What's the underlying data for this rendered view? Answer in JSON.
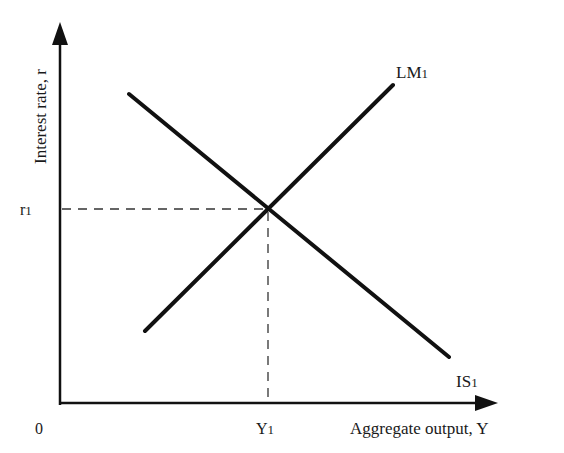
{
  "diagram": {
    "type": "IS-LM",
    "y_axis_label": "Interest rate, r",
    "x_axis_label": "Aggregate output, Y",
    "origin_label": "0",
    "r_label": "r",
    "r_sub": "1",
    "y_label": "Y",
    "y_sub": "1",
    "curves": [
      {
        "name": "LM",
        "sub": "1",
        "slope": "upward"
      },
      {
        "name": "IS",
        "sub": "1",
        "slope": "downward"
      }
    ],
    "equilibrium": {
      "r": "r1",
      "Y": "Y1"
    },
    "colors": {
      "line": "#111111",
      "dashed": "#333333",
      "background": "#ffffff"
    }
  }
}
